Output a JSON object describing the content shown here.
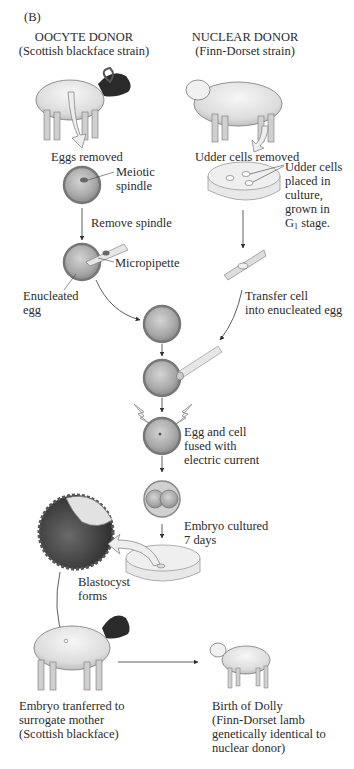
{
  "figure": {
    "panel_label": "(B)",
    "oocyte_donor": {
      "title": "OOCYTE DONOR",
      "strain": "(Scottish blackface strain)"
    },
    "nuclear_donor": {
      "title": "NUCLEAR DONOR",
      "strain": "(Finn-Dorset strain)"
    },
    "steps": {
      "eggs_removed": "Eggs removed",
      "udder_cells_removed": "Udder cells removed",
      "meiotic_spindle_1": "Meiotic",
      "meiotic_spindle_2": "spindle",
      "udder_culture_1": "Udder cells",
      "udder_culture_2": "placed in",
      "udder_culture_3": "culture,",
      "udder_culture_4": "grown in",
      "udder_culture_5_g": "G",
      "udder_culture_5_sub": "1",
      "udder_culture_5_rest": " stage.",
      "remove_spindle": "Remove spindle",
      "micropipette": "Micropipette",
      "enucleated_egg_1": "Enucleated",
      "enucleated_egg_2": "egg",
      "transfer_cell_1": "Transfer cell",
      "transfer_cell_2": "into enucleated egg",
      "fused_1": "Egg and cell",
      "fused_2": "fused with",
      "fused_3": "electric current",
      "embryo_cultured_1": "Embryo cultured",
      "embryo_cultured_2": "7 days",
      "blastocyst_1": "Blastocyst",
      "blastocyst_2": "forms",
      "surrogate_1": "Embryo tranferred to",
      "surrogate_2": "surrogate mother",
      "surrogate_3": "(Scottish blackface)",
      "dolly_1": "Birth of Dolly",
      "dolly_2": "(Finn-Dorset lamb",
      "dolly_3": "genetically identical to",
      "dolly_4": "nuclear donor)"
    },
    "colors": {
      "egg_fill": "#b0b0b0",
      "egg_ring": "#d8d8d8",
      "arrow_fill": "#e8e8e8",
      "line": "#3a3a3a",
      "blackface": "#2a2a2a"
    }
  }
}
